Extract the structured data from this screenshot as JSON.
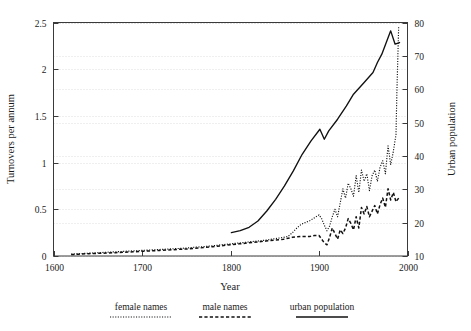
{
  "chart_data": {
    "type": "line",
    "title": "",
    "xlabel": "Year",
    "ylabel": "Turnovers per annum",
    "y2label": "Urban population",
    "xlim": [
      1600,
      2000
    ],
    "ylim": [
      0,
      2.5
    ],
    "y2lim": [
      10,
      80
    ],
    "xticks": [
      1600,
      1700,
      1800,
      1900,
      2000
    ],
    "xtick_labels": [
      "1600",
      "1700",
      "1800",
      "1900",
      "2000"
    ],
    "yticks": [
      0,
      0.5,
      1,
      1.5,
      2,
      2.5
    ],
    "ytick_labels": [
      "0",
      "0.5",
      "1",
      "1.5",
      "2",
      "2.5"
    ],
    "y2ticks": [
      10,
      20,
      30,
      40,
      50,
      60,
      70,
      80
    ],
    "y2tick_labels": [
      "10",
      "20",
      "30",
      "40",
      "50",
      "60",
      "70",
      "80"
    ],
    "grid": true,
    "grid_orientation": "horizontal",
    "legend_position": "below-outside",
    "series": [
      {
        "name": "female names",
        "style": "dotted",
        "axis": "left",
        "x": [
          1620,
          1630,
          1640,
          1650,
          1660,
          1670,
          1680,
          1690,
          1700,
          1710,
          1720,
          1730,
          1740,
          1750,
          1760,
          1770,
          1780,
          1790,
          1800,
          1810,
          1820,
          1830,
          1840,
          1850,
          1860,
          1865,
          1870,
          1875,
          1880,
          1885,
          1890,
          1895,
          1900,
          1903,
          1906,
          1909,
          1912,
          1915,
          1918,
          1921,
          1924,
          1927,
          1930,
          1933,
          1936,
          1939,
          1942,
          1945,
          1948,
          1951,
          1954,
          1957,
          1960,
          1963,
          1966,
          1969,
          1972,
          1975,
          1978,
          1981,
          1984,
          1987,
          1988,
          1989,
          1990
        ],
        "y": [
          0.02,
          0.025,
          0.03,
          0.035,
          0.04,
          0.045,
          0.05,
          0.055,
          0.06,
          0.065,
          0.07,
          0.075,
          0.08,
          0.085,
          0.095,
          0.1,
          0.11,
          0.12,
          0.13,
          0.14,
          0.15,
          0.16,
          0.17,
          0.185,
          0.2,
          0.21,
          0.25,
          0.3,
          0.34,
          0.36,
          0.38,
          0.41,
          0.44,
          0.4,
          0.33,
          0.27,
          0.32,
          0.42,
          0.5,
          0.42,
          0.57,
          0.72,
          0.62,
          0.78,
          0.72,
          0.64,
          0.86,
          0.68,
          0.92,
          0.8,
          0.88,
          0.7,
          0.86,
          0.92,
          0.8,
          0.95,
          1.02,
          0.88,
          1.18,
          0.98,
          1.12,
          1.3,
          1.75,
          2.1,
          2.45
        ]
      },
      {
        "name": "male names",
        "style": "dashed",
        "axis": "left",
        "x": [
          1620,
          1630,
          1640,
          1650,
          1660,
          1670,
          1680,
          1690,
          1700,
          1710,
          1720,
          1730,
          1740,
          1750,
          1760,
          1770,
          1780,
          1790,
          1800,
          1810,
          1820,
          1830,
          1840,
          1850,
          1860,
          1870,
          1880,
          1885,
          1890,
          1895,
          1900,
          1903,
          1906,
          1909,
          1912,
          1915,
          1918,
          1921,
          1924,
          1927,
          1930,
          1933,
          1936,
          1939,
          1942,
          1945,
          1948,
          1951,
          1954,
          1957,
          1960,
          1963,
          1966,
          1969,
          1972,
          1975,
          1978,
          1981,
          1984,
          1987,
          1990
        ],
        "y": [
          0.015,
          0.02,
          0.025,
          0.028,
          0.032,
          0.036,
          0.04,
          0.045,
          0.05,
          0.055,
          0.06,
          0.065,
          0.07,
          0.075,
          0.082,
          0.09,
          0.1,
          0.11,
          0.12,
          0.13,
          0.14,
          0.15,
          0.16,
          0.17,
          0.18,
          0.2,
          0.21,
          0.21,
          0.21,
          0.22,
          0.22,
          0.18,
          0.14,
          0.12,
          0.2,
          0.3,
          0.24,
          0.18,
          0.28,
          0.24,
          0.3,
          0.4,
          0.35,
          0.28,
          0.42,
          0.3,
          0.52,
          0.45,
          0.53,
          0.42,
          0.48,
          0.54,
          0.45,
          0.55,
          0.62,
          0.52,
          0.72,
          0.6,
          0.68,
          0.58,
          0.62
        ]
      },
      {
        "name": "urban population",
        "style": "solid",
        "axis": "right",
        "x": [
          1801,
          1811,
          1821,
          1831,
          1841,
          1851,
          1861,
          1871,
          1881,
          1891,
          1901,
          1906,
          1911,
          1921,
          1931,
          1939,
          1951,
          1961,
          1966,
          1971,
          1976,
          1981,
          1986,
          1991
        ],
        "y": [
          17.0,
          17.6,
          18.6,
          20.5,
          23.5,
          27.0,
          31.0,
          35.5,
          40.5,
          44.5,
          48.0,
          45.0,
          47.5,
          51.0,
          55.0,
          58.5,
          62.0,
          65.0,
          68.0,
          70.5,
          74.0,
          77.5,
          73.5,
          74.0
        ]
      }
    ],
    "legend": [
      {
        "label": "female names",
        "style": "dotted"
      },
      {
        "label": "male names",
        "style": "dashed"
      },
      {
        "label": "urban population",
        "style": "solid"
      }
    ]
  },
  "colors": {
    "background": "#ffffff",
    "ink": "#111111",
    "frame": "#3a3a3a",
    "grid": "#c9c9c9"
  }
}
